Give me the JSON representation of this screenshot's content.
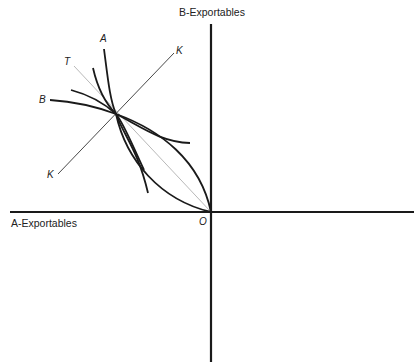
{
  "axes": {
    "y_label": "B-Exportables",
    "x_label": "A-Exportables",
    "origin_label": "O"
  },
  "curves": {
    "a_label": "A",
    "b_label": "B",
    "t_label": "T",
    "k_top_label": "K",
    "k_bottom_label": "K"
  },
  "colors": {
    "line": "#1a1a1a",
    "thin": "#888888",
    "background": "#ffffff"
  }
}
